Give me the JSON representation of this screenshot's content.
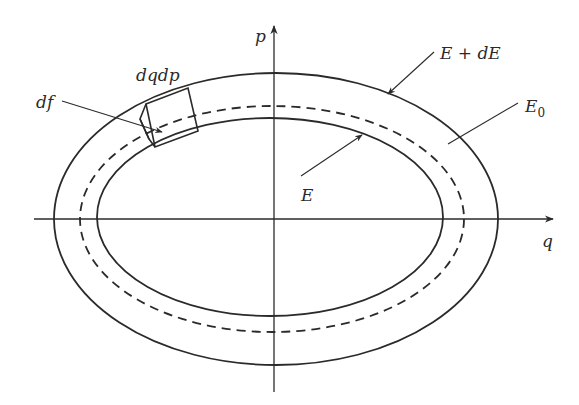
{
  "diagram": {
    "axes": {
      "horizontal_label": "q",
      "vertical_label": "p"
    },
    "curves": [
      {
        "id": "outer",
        "label": "E + dE",
        "style": "solid"
      },
      {
        "id": "middle",
        "label": "E_0",
        "style": "dashed"
      },
      {
        "id": "inner",
        "label": "E",
        "style": "solid"
      }
    ],
    "labels": {
      "outer_energy": "E + dE",
      "reference_energy_base": "E",
      "reference_energy_sub": "0",
      "inner_energy": "E",
      "volume_element": "dqdp",
      "surface_element": "df",
      "q_axis": "q",
      "p_axis": "p"
    },
    "colors": {
      "line": "#2a2a2a",
      "background": "#ffffff"
    }
  }
}
